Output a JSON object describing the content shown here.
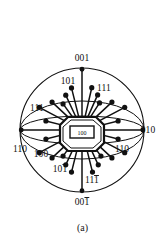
{
  "figure": {
    "caption": "(a)",
    "type": "stereographic-projection",
    "center_label": "100",
    "primitive_circle": {
      "cx": 82,
      "cy": 130,
      "r": 62
    }
  },
  "labels": {
    "top": {
      "text": "001",
      "x": 82,
      "y": 61
    },
    "bottom_main": {
      "text": "00",
      "bar": "1",
      "x": 82,
      "y": 205
    },
    "right": {
      "text": "010",
      "x": 148,
      "y": 133
    },
    "left_110": {
      "text": "110",
      "x": 20,
      "y": 152
    },
    "right_110": {
      "text": "110",
      "x": 122,
      "y": 152
    },
    "upper_left_101": {
      "text": "101",
      "x": 68,
      "y": 84
    },
    "upper_right_111": {
      "text": "111",
      "x": 104,
      "y": 91
    },
    "left_111": {
      "text": "111",
      "x": 37,
      "y": 111
    },
    "lower_left_100": {
      "text": "100",
      "x": 41,
      "y": 157
    },
    "lower_101bar": {
      "text": "10",
      "bar": "1",
      "x": 60,
      "y": 172
    },
    "lower_111bar": {
      "text": "11",
      "bar": "1",
      "x": 92,
      "y": 183
    }
  },
  "chart_data": {
    "type": "scatter",
    "title": "",
    "subtitle": "",
    "xlabel": "",
    "ylabel": "",
    "grid": false,
    "legend": null,
    "annotations": [
      "001",
      "00̅1",
      "010",
      "110",
      "110",
      "101",
      "111",
      "111",
      "100",
      "10̅1",
      "11̅1",
      "100"
    ],
    "poles": [
      {
        "id": "001",
        "angle_deg": 90,
        "r_frac": 1.0,
        "label": "001"
      },
      {
        "id": "001b",
        "angle_deg": 270,
        "r_frac": 1.0,
        "label": "001̅"
      },
      {
        "id": "010",
        "angle_deg": 0,
        "r_frac": 1.0,
        "label": "010"
      },
      {
        "id": "110L",
        "angle_deg": 180,
        "r_frac": 1.0,
        "label": "110"
      },
      {
        "id": "100c",
        "angle_deg": 0,
        "r_frac": 0.0,
        "label": "100"
      }
    ],
    "rays": [
      {
        "angle_deg": 90,
        "r_frac": 0.98
      },
      {
        "angle_deg": 77,
        "r_frac": 0.7
      },
      {
        "angle_deg": 66,
        "r_frac": 0.62
      },
      {
        "angle_deg": 57,
        "r_frac": 0.52
      },
      {
        "angle_deg": 104,
        "r_frac": 0.7
      },
      {
        "angle_deg": 115,
        "r_frac": 0.62
      },
      {
        "angle_deg": 126,
        "r_frac": 0.52
      },
      {
        "angle_deg": 137,
        "r_frac": 0.66
      },
      {
        "angle_deg": 152,
        "r_frac": 0.78
      },
      {
        "angle_deg": 166,
        "r_frac": 0.6
      },
      {
        "angle_deg": 180,
        "r_frac": 0.98
      },
      {
        "angle_deg": 194,
        "r_frac": 0.6
      },
      {
        "angle_deg": 208,
        "r_frac": 0.78
      },
      {
        "angle_deg": 223,
        "r_frac": 0.66
      },
      {
        "angle_deg": 234,
        "r_frac": 0.52
      },
      {
        "angle_deg": 245,
        "r_frac": 0.62
      },
      {
        "angle_deg": 256,
        "r_frac": 0.7
      },
      {
        "angle_deg": 270,
        "r_frac": 0.98
      },
      {
        "angle_deg": 284,
        "r_frac": 0.7
      },
      {
        "angle_deg": 295,
        "r_frac": 0.62
      },
      {
        "angle_deg": 306,
        "r_frac": 0.52
      },
      {
        "angle_deg": 317,
        "r_frac": 0.66
      },
      {
        "angle_deg": 332,
        "r_frac": 0.78
      },
      {
        "angle_deg": 346,
        "r_frac": 0.6
      },
      {
        "angle_deg": 0,
        "r_frac": 0.98
      },
      {
        "angle_deg": 14,
        "r_frac": 0.6
      },
      {
        "angle_deg": 28,
        "r_frac": 0.78
      },
      {
        "angle_deg": 43,
        "r_frac": 0.66
      }
    ],
    "arcs": [
      {
        "name": "upper-lens",
        "ry_frac": 0.46
      },
      {
        "name": "lower-lens",
        "ry_frac": 0.46
      },
      {
        "name": "upper-lens2",
        "ry_frac": 0.22
      },
      {
        "name": "lower-lens2",
        "ry_frac": 0.22
      }
    ]
  }
}
